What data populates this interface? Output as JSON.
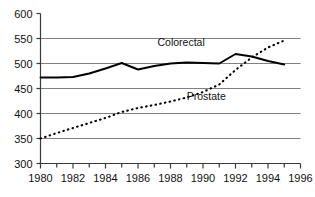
{
  "chart_data": {
    "type": "line",
    "title": "",
    "xlabel": "",
    "ylabel": "",
    "xlim": [
      1980,
      1996
    ],
    "ylim": [
      300,
      600
    ],
    "x_tick_step": 1,
    "x_label_step": 2,
    "y_tick_step": 50,
    "grid": "horizontal gridlines at 350, 400, 450, 500, 550 (none at 300 or 600)",
    "legend": "inline series labels placed next to each curve",
    "x_tick_labels": [
      "1980",
      "1982",
      "1984",
      "1986",
      "1988",
      "1990",
      "1992",
      "1994",
      "1996"
    ],
    "x_tick_values": [
      1980,
      1982,
      1984,
      1986,
      1988,
      1990,
      1992,
      1994,
      1996
    ],
    "y_tick_labels": [
      "300",
      "350",
      "400",
      "450",
      "500",
      "550",
      "600"
    ],
    "y_tick_values": [
      300,
      350,
      400,
      450,
      500,
      550,
      600
    ],
    "x": [
      1980,
      1981,
      1982,
      1983,
      1984,
      1985,
      1986,
      1987,
      1988,
      1989,
      1990,
      1991,
      1992,
      1993,
      1994,
      1995
    ],
    "series": [
      {
        "name": "Colorectal",
        "style": "solid",
        "color": "#000000",
        "label_x": 1987.2,
        "label_y": 536,
        "values": [
          472,
          472,
          473,
          480,
          490,
          501,
          488,
          495,
          500,
          502,
          501,
          500,
          519,
          514,
          505,
          498
        ]
      },
      {
        "name": "Prostate",
        "style": "dotted",
        "color": "#000000",
        "label_x": 1989.0,
        "label_y": 428,
        "values": [
          350,
          361,
          371,
          381,
          391,
          403,
          411,
          417,
          424,
          432,
          443,
          458,
          487,
          512,
          532,
          546
        ]
      }
    ]
  },
  "axis": {
    "axis_color": "#3a3a3a",
    "grid_color": "#808080",
    "text_color": "#111111"
  }
}
